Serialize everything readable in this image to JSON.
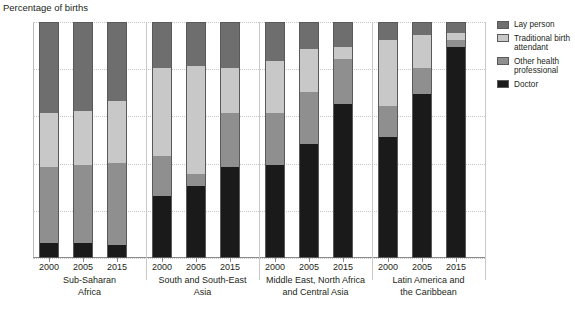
{
  "chart_data": {
    "type": "bar",
    "subtype": "stacked-bar-grouped",
    "title": "",
    "ylabel": "Percentage of births",
    "xlabel": "",
    "ylim": [
      0,
      100
    ],
    "yticks": [
      0,
      20,
      40,
      60,
      80,
      100
    ],
    "grid": true,
    "stack_order_bottom_to_top": [
      "Doctor",
      "Other health professional",
      "Traditional birth attendant",
      "Lay person"
    ],
    "legend_position": "right",
    "legend": [
      {
        "label": "Lay person",
        "color": "#6e6e6e"
      },
      {
        "label": "Traditional birth attendant",
        "color": "#c8c8c8"
      },
      {
        "label": "Other health professional",
        "color": "#8f8f8f"
      },
      {
        "label": "Doctor",
        "color": "#1a1a1a"
      }
    ],
    "colors": {
      "lay_person": "#6e6e6e",
      "traditional_birth_attendant": "#c8c8c8",
      "other_health_professional": "#8f8f8f",
      "doctor": "#1a1a1a"
    },
    "groups": [
      {
        "name": "Sub-Saharan Africa",
        "name_lines": [
          "Sub-Saharan",
          "Africa"
        ],
        "categories": [
          "2000",
          "2005",
          "2015"
        ],
        "bars": [
          {
            "year": "2000",
            "Doctor": 6,
            "Other health professional": 32,
            "Traditional birth attendant": 23,
            "Lay person": 39
          },
          {
            "year": "2005",
            "Doctor": 6,
            "Other health professional": 33,
            "Traditional birth attendant": 23,
            "Lay person": 38
          },
          {
            "year": "2015",
            "Doctor": 5,
            "Other health professional": 35,
            "Traditional birth attendant": 26,
            "Lay person": 34
          }
        ]
      },
      {
        "name": "South and South-East Asia",
        "name_lines": [
          "South and South-East",
          "Asia"
        ],
        "categories": [
          "2000",
          "2005",
          "2015"
        ],
        "bars": [
          {
            "year": "2000",
            "Doctor": 26,
            "Other health professional": 17,
            "Traditional birth attendant": 37,
            "Lay person": 20
          },
          {
            "year": "2005",
            "Doctor": 30,
            "Other health professional": 5,
            "Traditional birth attendant": 46,
            "Lay person": 19
          },
          {
            "year": "2015",
            "Doctor": 38,
            "Other health professional": 23,
            "Traditional birth attendant": 19,
            "Lay person": 20
          }
        ]
      },
      {
        "name": "Middle East, North Africa and Central Asia",
        "name_lines": [
          "Middle East, North Africa",
          "and Central Asia"
        ],
        "categories": [
          "2000",
          "2005",
          "2015"
        ],
        "bars": [
          {
            "year": "2000",
            "Doctor": 39,
            "Other health professional": 22,
            "Traditional birth attendant": 22,
            "Lay person": 17
          },
          {
            "year": "2005",
            "Doctor": 48,
            "Other health professional": 22,
            "Traditional birth attendant": 18,
            "Lay person": 12
          },
          {
            "year": "2015",
            "Doctor": 65,
            "Other health professional": 19,
            "Traditional birth attendant": 5,
            "Lay person": 11
          }
        ]
      },
      {
        "name": "Latin America and the Caribbean",
        "name_lines": [
          "Latin America and",
          "the Caribbean"
        ],
        "categories": [
          "2000",
          "2005",
          "2015"
        ],
        "bars": [
          {
            "year": "2000",
            "Doctor": 51,
            "Other health professional": 13,
            "Traditional birth attendant": 28,
            "Lay person": 8
          },
          {
            "year": "2005",
            "Doctor": 69,
            "Other health professional": 11,
            "Traditional birth attendant": 14,
            "Lay person": 6
          },
          {
            "year": "2015",
            "Doctor": 89,
            "Other health professional": 3,
            "Traditional birth attendant": 3,
            "Lay person": 5
          }
        ]
      }
    ]
  }
}
